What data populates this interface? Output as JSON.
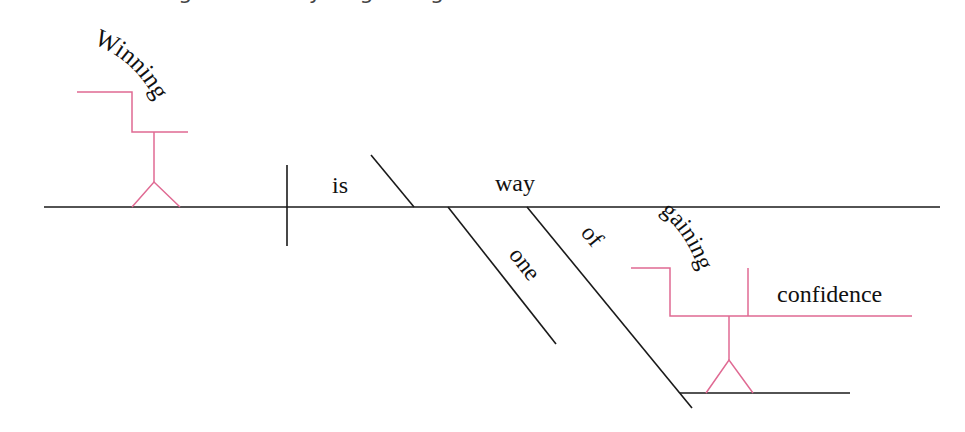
{
  "caption": {
    "text": "Winning is one way of gaining confidence.",
    "clipped": true
  },
  "colors": {
    "line": "#1a1a1a",
    "modifier_line": "#e06a93",
    "text": "#111111",
    "background": "#ffffff"
  },
  "diagram": {
    "type": "Reed-Kellogg sentence diagram",
    "words": {
      "subject": "Winning",
      "verb": "is",
      "predicate_noun": "way",
      "modifier_one": "one",
      "preposition": "of",
      "gerund": "gaining",
      "object": "confidence"
    }
  }
}
